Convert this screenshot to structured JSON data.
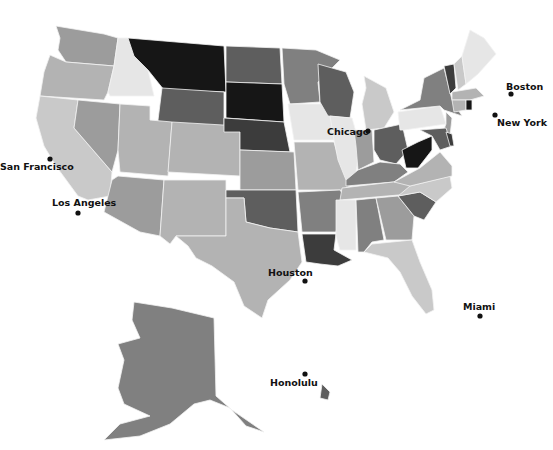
{
  "map": {
    "title_fragment": "",
    "style": "grayscale choropleth of United States",
    "shades": {
      "lightest": "#e6e6e6",
      "light": "#c9c9c9",
      "mid_light": "#b3b3b3",
      "mid": "#9c9c9c",
      "mid_dark": "#808080",
      "dark": "#5e5e5e",
      "darker": "#3c3c3c",
      "darkest": "#161616"
    },
    "states": [
      {
        "id": "WA",
        "shade": "mid",
        "points": "56,26 104,34 118,38 114,66 66,62 58,50 60,38"
      },
      {
        "id": "OR",
        "shade": "mid_light",
        "points": "50,55 66,62 114,66 108,92 104,100 40,96 44,72"
      },
      {
        "id": "CA",
        "shade": "light",
        "points": "40,96 78,100 74,128 112,172 110,196 88,200 78,196 56,166 44,146 36,118"
      },
      {
        "id": "ID",
        "shade": "lightest",
        "points": "118,38 128,38 134,56 148,70 154,96 110,96 108,92 114,66"
      },
      {
        "id": "NV",
        "shade": "mid",
        "points": "78,100 120,104 118,150 112,172 74,128"
      },
      {
        "id": "MT",
        "shade": "darkest",
        "points": "128,38 224,46 226,92 164,90 148,70 134,56"
      },
      {
        "id": "WY",
        "shade": "dark",
        "points": "162,88 224,92 224,140 156,136"
      },
      {
        "id": "UT",
        "shade": "mid_light",
        "points": "120,104 150,106 150,120 172,122 168,176 120,172 118,150"
      },
      {
        "id": "CO",
        "shade": "mid_light",
        "points": "172,122 240,126 240,176 168,172"
      },
      {
        "id": "AZ",
        "shade": "mid",
        "points": "118,176 164,180 160,236 140,232 104,212 108,196 112,180"
      },
      {
        "id": "NM",
        "shade": "mid_light",
        "points": "164,180 226,180 226,236 176,236 170,244 160,236"
      },
      {
        "id": "ND",
        "shade": "dark",
        "points": "226,46 280,48 282,84 226,82"
      },
      {
        "id": "SD",
        "shade": "darkest",
        "points": "226,82 282,84 284,122 226,118"
      },
      {
        "id": "NE",
        "shade": "darker",
        "points": "224,118 284,122 290,152 240,150 240,132 224,132"
      },
      {
        "id": "KS",
        "shade": "mid",
        "points": "240,150 294,152 296,190 240,190"
      },
      {
        "id": "OK",
        "shade": "dark",
        "points": "226,190 296,190 298,232 270,228 246,222 244,198 226,198"
      },
      {
        "id": "TX",
        "shade": "mid_light",
        "points": "226,198 244,198 246,222 270,228 298,232 302,262 290,280 268,300 262,318 244,306 234,282 212,266 196,258 188,246 176,236 226,236"
      },
      {
        "id": "MN",
        "shade": "mid_dark",
        "points": "282,48 316,50 340,60 318,82 320,102 290,104 284,84"
      },
      {
        "id": "IA",
        "shade": "lightest",
        "points": "288,104 330,104 342,128 334,140 294,140"
      },
      {
        "id": "MO",
        "shade": "mid_light",
        "points": "294,142 334,142 340,162 354,184 342,190 298,190"
      },
      {
        "id": "AR",
        "shade": "mid_dark",
        "points": "298,192 340,190 344,196 336,232 302,232"
      },
      {
        "id": "LA",
        "shade": "darker",
        "points": "302,234 336,234 334,250 352,260 338,266 320,264 306,262"
      },
      {
        "id": "WI",
        "shade": "dark",
        "points": "318,64 346,72 354,92 350,118 328,116 320,102"
      },
      {
        "id": "IL",
        "shade": "lightest",
        "points": "330,116 352,118 360,146 356,172 346,180 338,160 334,140"
      },
      {
        "id": "MI",
        "shade": "light",
        "points": "364,76 386,88 394,112 384,128 366,130 362,104 366,88"
      },
      {
        "id": "IN",
        "shade": "mid",
        "points": "354,130 372,130 374,162 358,170 356,146"
      },
      {
        "id": "OH",
        "shade": "dark",
        "points": "374,130 402,124 408,150 396,164 380,160 374,150"
      },
      {
        "id": "KY",
        "shade": "mid_dark",
        "points": "346,180 358,170 380,162 400,164 408,172 394,182 346,186"
      },
      {
        "id": "TN",
        "shade": "mid_light",
        "points": "342,188 410,180 420,186 410,194 340,200"
      },
      {
        "id": "MS",
        "shade": "lightest",
        "points": "336,200 356,200 356,250 340,250 336,236"
      },
      {
        "id": "AL",
        "shade": "mid_dark",
        "points": "356,200 376,198 384,240 372,242 364,252 358,252"
      },
      {
        "id": "GA",
        "shade": "mid",
        "points": "376,198 398,196 414,216 412,240 386,240"
      },
      {
        "id": "FL",
        "shade": "light",
        "points": "364,252 372,244 412,240 420,262 432,290 434,310 426,314 412,296 400,272 388,258"
      },
      {
        "id": "SC",
        "shade": "dark",
        "points": "398,196 420,192 436,202 424,220 414,216"
      },
      {
        "id": "NC",
        "shade": "light",
        "points": "410,186 450,176 452,188 436,202 420,192 398,196"
      },
      {
        "id": "VA",
        "shade": "mid_light",
        "points": "394,182 420,168 440,152 452,166 452,176 410,186"
      },
      {
        "id": "WV",
        "shade": "darkest",
        "points": "402,150 418,142 432,136 432,150 418,168 406,168"
      },
      {
        "id": "PA",
        "shade": "lightest",
        "points": "398,112 440,106 446,124 404,130 400,130"
      },
      {
        "id": "NY",
        "shade": "mid_dark",
        "points": "400,110 420,100 424,78 444,68 452,100 462,116 444,110 440,106"
      },
      {
        "id": "NJ",
        "shade": "mid",
        "points": "446,112 452,118 450,136 442,134 446,124"
      },
      {
        "id": "MD",
        "shade": "dark",
        "points": "420,130 446,128 452,146 440,150 432,136"
      },
      {
        "id": "DE",
        "shade": "darker",
        "points": "446,132 452,134 454,146 450,146"
      },
      {
        "id": "VT",
        "shade": "darker",
        "points": "444,66 454,64 456,88 450,94"
      },
      {
        "id": "NH",
        "shade": "light",
        "points": "454,64 462,56 466,84 458,90"
      },
      {
        "id": "ME",
        "shade": "lightest",
        "points": "462,56 470,30 484,38 496,54 478,74 466,84"
      },
      {
        "id": "MA",
        "shade": "mid_light",
        "points": "452,92 476,88 484,96 470,100 452,100"
      },
      {
        "id": "CT",
        "shade": "mid_light",
        "points": "452,100 466,100 466,110 454,112"
      },
      {
        "id": "RI",
        "shade": "darkest",
        "points": "466,100 472,100 472,110 466,110"
      },
      {
        "id": "AK",
        "shade": "mid_dark",
        "points": "134,302 172,308 214,318 216,396 232,410 264,432 246,426 230,408 210,400 194,404 170,424 140,436 104,440 120,424 150,416 124,404 118,388 124,360 118,344 140,338 132,320"
      },
      {
        "id": "HI",
        "shade": "dark",
        "points": "322,384 330,392 328,400 320,398"
      }
    ],
    "cities": [
      {
        "name": "San Francisco",
        "x": 50,
        "y": 159,
        "label_x": 0,
        "label_y": 170,
        "anchor": "start"
      },
      {
        "name": "Los Angeles",
        "x": 78,
        "y": 213,
        "label_x": 52,
        "label_y": 206,
        "anchor": "start"
      },
      {
        "name": "Houston",
        "x": 305,
        "y": 281,
        "label_x": 268,
        "label_y": 276,
        "anchor": "start"
      },
      {
        "name": "Chicago",
        "x": 368,
        "y": 131,
        "label_x": 327,
        "label_y": 135,
        "anchor": "start"
      },
      {
        "name": "Boston",
        "x": 511,
        "y": 94,
        "label_x": 506,
        "label_y": 90,
        "anchor": "start"
      },
      {
        "name": "New York",
        "x": 495,
        "y": 115,
        "label_x": 497,
        "label_y": 126,
        "anchor": "start"
      },
      {
        "name": "Miami",
        "x": 480,
        "y": 316,
        "label_x": 463,
        "label_y": 310,
        "anchor": "start"
      },
      {
        "name": "Honolulu",
        "x": 305,
        "y": 374,
        "label_x": 270,
        "label_y": 386,
        "anchor": "start"
      }
    ]
  }
}
